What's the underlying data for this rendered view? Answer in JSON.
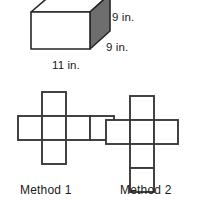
{
  "figure": {
    "prism": {
      "name": "rectangular-prism",
      "shaded_face_color": "#6e6e6e",
      "front_face_color": "#ffffff",
      "top_face_color": "#ffffff",
      "outline_color": "#262626",
      "labels": {
        "height": "9 in.",
        "depth": "9 in.",
        "width": "11 in."
      }
    },
    "nets": [
      {
        "name": "method-1",
        "caption": "Method 1",
        "layout": "horizontal-cross",
        "squares": 6
      },
      {
        "name": "method-2",
        "caption": "Method 2",
        "layout": "vertical-cross",
        "squares": 6
      }
    ],
    "net_stroke_color": "#3a3a3a",
    "net_fill_color": "#ffffff"
  }
}
